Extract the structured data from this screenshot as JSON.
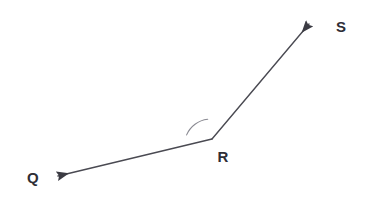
{
  "figure": {
    "type": "geometry-diagram",
    "width": 373,
    "height": 204,
    "background_color": "#ffffff",
    "stroke_color": "#4a4a52",
    "arc_color": "#8a8a92",
    "label_color": "#2e2e36",
    "stroke_width": 1.4
  },
  "points": {
    "vertex": {
      "name": "R",
      "x": 212,
      "y": 139
    },
    "ray_q_tip": {
      "name": "Q",
      "x": 53,
      "y": 177
    },
    "ray_s_tip": {
      "name": "S",
      "x": 313,
      "y": 20
    }
  },
  "labels": [
    {
      "id": "label-q",
      "text": "Q",
      "x": 33,
      "y": 177
    },
    {
      "id": "label-r",
      "text": "R",
      "x": 223,
      "y": 156
    },
    {
      "id": "label-s",
      "text": "S",
      "x": 341,
      "y": 26
    }
  ],
  "rays": [
    {
      "id": "ray-rq",
      "from": "R",
      "to": "Q",
      "arrow": "end"
    },
    {
      "id": "ray-rs",
      "from": "R",
      "to": "S",
      "arrow": "end"
    }
  ],
  "angle_arc": {
    "id": "angle-arc-qrs",
    "vertex": "R",
    "radius": 26,
    "start_x": 188,
    "start_y": 134,
    "end_x": 208,
    "end_y": 120
  }
}
